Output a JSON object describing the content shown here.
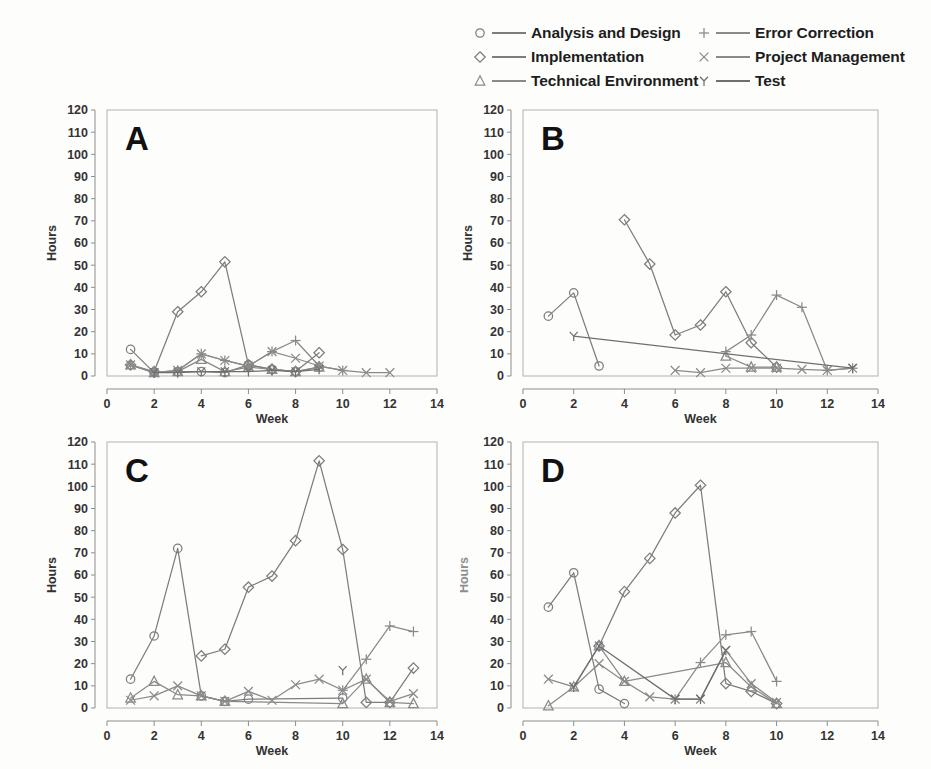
{
  "figure": {
    "background_color": "#fdfdfc",
    "ink_color": "#7b7b7b",
    "text_color": "#1d1d1d"
  },
  "legend": {
    "entries": [
      {
        "label": "Analysis and Design",
        "marker": "circle-icon",
        "marker_name": "circle",
        "color": "#7d7d7d",
        "column": 0,
        "row": 0
      },
      {
        "label": "Implementation",
        "marker": "diamond-icon",
        "marker_name": "diamond",
        "color": "#7d7d7d",
        "column": 0,
        "row": 1
      },
      {
        "label": "Technical Environment",
        "marker": "triangle-icon",
        "marker_name": "triangle",
        "color": "#8a8a8a",
        "column": 0,
        "row": 2
      },
      {
        "label": "Error Correction",
        "marker": "plus-icon",
        "marker_name": "plus",
        "color": "#8a8a8a",
        "column": 1,
        "row": 0
      },
      {
        "label": "Project Management",
        "marker": "times-icon",
        "marker_name": "times",
        "color": "#8a8a8a",
        "column": 1,
        "row": 1
      },
      {
        "label": "Test",
        "marker": "y-glyph-icon",
        "marker_name": "Y",
        "color": "#6f6f6f",
        "column": 1,
        "row": 2
      }
    ]
  },
  "chart_data": [
    {
      "id": "A",
      "type": "line",
      "title": "A",
      "xlabel": "Week",
      "ylabel": "Hours",
      "xlim": [
        0,
        14
      ],
      "ylim": [
        0,
        120
      ],
      "xticks": [
        0,
        2,
        4,
        6,
        8,
        10,
        12,
        14
      ],
      "yticks": [
        0,
        10,
        20,
        30,
        40,
        50,
        60,
        70,
        80,
        90,
        100,
        110,
        120
      ],
      "xtick_labels": [
        "0",
        "2",
        "4",
        "6",
        "8",
        "10",
        "12",
        "14"
      ],
      "ytick_labels": [
        "0",
        "10",
        "20",
        "30",
        "40",
        "50",
        "60",
        "70",
        "80",
        "90",
        "100",
        "110",
        "120"
      ],
      "grid": false,
      "legend_position": "figure-top",
      "series": [
        {
          "name": "Analysis and Design",
          "marker": "circle",
          "x": [
            1,
            2,
            3,
            4,
            5,
            6,
            7,
            8,
            9
          ],
          "values": [
            12,
            1.5,
            2,
            2,
            1.5,
            5,
            3,
            2,
            4
          ]
        },
        {
          "name": "Implementation",
          "marker": "diamond",
          "x": [
            1,
            2,
            3,
            4,
            5,
            6,
            7,
            8,
            9
          ],
          "values": [
            5,
            2,
            29,
            38,
            51.5,
            5,
            3,
            2,
            10.5
          ]
        },
        {
          "name": "Technical Environment",
          "marker": "triangle",
          "x": [
            1,
            2,
            3,
            4,
            5,
            6,
            7,
            8,
            9
          ],
          "values": [
            5,
            1.5,
            2,
            7.5,
            2,
            4,
            3,
            2,
            4
          ]
        },
        {
          "name": "Error Correction",
          "marker": "plus",
          "x": [
            1,
            2,
            3,
            4,
            5,
            6,
            7,
            8,
            9,
            10
          ],
          "values": [
            5,
            1.5,
            2.5,
            10,
            7,
            4.5,
            11,
            16,
            4.5,
            2.5
          ]
        },
        {
          "name": "Project Management",
          "marker": "times",
          "x": [
            1,
            2,
            3,
            4,
            5,
            6,
            7,
            8,
            9,
            10,
            11,
            12
          ],
          "values": [
            5,
            1.5,
            2.5,
            10,
            7,
            4.5,
            11,
            8,
            4.5,
            2.5,
            1.5,
            1.5
          ]
        },
        {
          "name": "Test",
          "marker": "Y",
          "x": [
            2,
            3,
            4,
            5,
            6,
            7,
            8,
            9
          ],
          "values": [
            1.5,
            1.5,
            2,
            2,
            2,
            2.5,
            2,
            3
          ]
        }
      ]
    },
    {
      "id": "B",
      "type": "line",
      "title": "B",
      "xlabel": "Week",
      "ylabel": "Hours",
      "xlim": [
        0,
        14
      ],
      "ylim": [
        0,
        120
      ],
      "xticks": [
        0,
        2,
        4,
        6,
        8,
        10,
        12,
        14
      ],
      "yticks": [
        0,
        10,
        20,
        30,
        40,
        50,
        60,
        70,
        80,
        90,
        100,
        110,
        120
      ],
      "xtick_labels": [
        "0",
        "2",
        "4",
        "6",
        "8",
        "10",
        "12",
        "14"
      ],
      "ytick_labels": [
        "0",
        "10",
        "20",
        "30",
        "40",
        "50",
        "60",
        "70",
        "80",
        "90",
        "100",
        "110",
        "120"
      ],
      "grid": false,
      "legend_position": "figure-top",
      "series": [
        {
          "name": "Analysis and Design",
          "marker": "circle",
          "x": [
            1,
            2,
            3
          ],
          "values": [
            27,
            37.5,
            4.5
          ]
        },
        {
          "name": "Implementation",
          "marker": "diamond",
          "x": [
            4,
            5,
            6,
            7,
            8,
            9,
            10
          ],
          "values": [
            70.5,
            50.5,
            18.5,
            23,
            38,
            15,
            4
          ]
        },
        {
          "name": "Technical Environment",
          "marker": "triangle",
          "x": [
            8,
            9,
            10
          ],
          "values": [
            9,
            4,
            4
          ]
        },
        {
          "name": "Error Correction",
          "marker": "plus",
          "x": [
            8,
            9,
            10,
            11,
            12,
            13
          ],
          "values": [
            11,
            18.5,
            36.5,
            31,
            2.5,
            3.5
          ]
        },
        {
          "name": "Project Management",
          "marker": "times",
          "x": [
            6,
            7,
            8,
            9,
            10,
            11,
            12,
            13
          ],
          "values": [
            2.5,
            1.5,
            3.5,
            3.5,
            3.5,
            3,
            2.5,
            3.5
          ]
        },
        {
          "name": "Test",
          "marker": "Y",
          "x": [
            2,
            13
          ],
          "values": [
            18,
            3.5
          ]
        }
      ]
    },
    {
      "id": "C",
      "type": "line",
      "title": "C",
      "xlabel": "Week",
      "ylabel": "Hours",
      "xlim": [
        0,
        14
      ],
      "ylim": [
        0,
        120
      ],
      "xticks": [
        0,
        2,
        4,
        6,
        8,
        10,
        12,
        14
      ],
      "yticks": [
        0,
        10,
        20,
        30,
        40,
        50,
        60,
        70,
        80,
        90,
        100,
        110,
        120
      ],
      "xtick_labels": [
        "0",
        "2",
        "4",
        "6",
        "8",
        "10",
        "12",
        "14"
      ],
      "ytick_labels": [
        "0",
        "10",
        "20",
        "30",
        "40",
        "50",
        "60",
        "70",
        "80",
        "90",
        "100",
        "110",
        "120"
      ],
      "grid": false,
      "legend_position": "figure-top",
      "series": [
        {
          "name": "Analysis and Design",
          "marker": "circle",
          "x": [
            1,
            2,
            3,
            4,
            5,
            6,
            10
          ],
          "values": [
            13,
            32.5,
            72,
            5.5,
            3,
            4,
            4.5
          ]
        },
        {
          "name": "Implementation",
          "marker": "diamond",
          "x": [
            4,
            5,
            6,
            7,
            8,
            9,
            10,
            11,
            12,
            13
          ],
          "values": [
            23.5,
            26.5,
            54.5,
            59.5,
            75.5,
            111.5,
            71.5,
            2.5,
            2.5,
            18
          ]
        },
        {
          "name": "Technical Environment",
          "marker": "triangle",
          "x": [
            1,
            2,
            3,
            4,
            5,
            10,
            11,
            12,
            13
          ],
          "values": [
            4.5,
            12,
            6,
            5.5,
            3,
            2,
            13,
            2.5,
            2
          ]
        },
        {
          "name": "Error Correction",
          "marker": "plus",
          "x": [
            10,
            11,
            12,
            13
          ],
          "values": [
            8,
            22,
            37,
            34.5
          ]
        },
        {
          "name": "Project Management",
          "marker": "times",
          "x": [
            1,
            2,
            3,
            4,
            5,
            6,
            7,
            8,
            9,
            10,
            11,
            12,
            13
          ],
          "values": [
            3.5,
            5.5,
            10,
            5.5,
            3,
            7.5,
            3.5,
            10.5,
            13,
            8,
            13,
            3,
            6.5
          ]
        },
        {
          "name": "Test",
          "marker": "Y",
          "x": [
            10
          ],
          "values": [
            17
          ]
        }
      ]
    },
    {
      "id": "D",
      "type": "line",
      "title": "D",
      "xlabel": "Week",
      "ylabel": "Hours",
      "xlim": [
        0,
        14
      ],
      "ylim": [
        0,
        120
      ],
      "xticks": [
        0,
        2,
        4,
        6,
        8,
        10,
        12,
        14
      ],
      "yticks": [
        0,
        10,
        20,
        30,
        40,
        50,
        60,
        70,
        80,
        90,
        100,
        110,
        120
      ],
      "xtick_labels": [
        "0",
        "2",
        "4",
        "6",
        "8",
        "10",
        "12",
        "14"
      ],
      "ytick_labels": [
        "0",
        "10",
        "20",
        "30",
        "40",
        "50",
        "60",
        "70",
        "80",
        "90",
        "100",
        "110",
        "120"
      ],
      "grid": false,
      "legend_position": "figure-top",
      "series": [
        {
          "name": "Analysis and Design",
          "marker": "circle",
          "x": [
            1,
            2,
            3,
            4
          ],
          "values": [
            45.5,
            61,
            8.5,
            2
          ]
        },
        {
          "name": "Implementation",
          "marker": "diamond",
          "x": [
            3,
            4,
            5,
            6,
            7,
            8,
            9,
            10
          ],
          "values": [
            28,
            52.5,
            67.5,
            88,
            100.5,
            11,
            7.5,
            2
          ]
        },
        {
          "name": "Technical Environment",
          "marker": "triangle",
          "x": [
            1,
            2,
            3,
            4,
            8,
            9,
            10
          ],
          "values": [
            1,
            9.5,
            28,
            12,
            20.5,
            9.5,
            2
          ]
        },
        {
          "name": "Error Correction",
          "marker": "plus",
          "x": [
            6,
            7,
            8,
            9,
            10
          ],
          "values": [
            4,
            20.5,
            33,
            34.5,
            12
          ]
        },
        {
          "name": "Project Management",
          "marker": "times",
          "x": [
            1,
            2,
            3,
            4,
            5,
            6,
            7,
            8,
            9,
            10
          ],
          "values": [
            13,
            9.5,
            20,
            12,
            5,
            4,
            4,
            26,
            11,
            2.5
          ]
        },
        {
          "name": "Test",
          "marker": "Y",
          "x": [
            2,
            3,
            6,
            7,
            8
          ],
          "values": [
            9.5,
            28,
            4,
            4,
            26
          ]
        }
      ]
    }
  ]
}
